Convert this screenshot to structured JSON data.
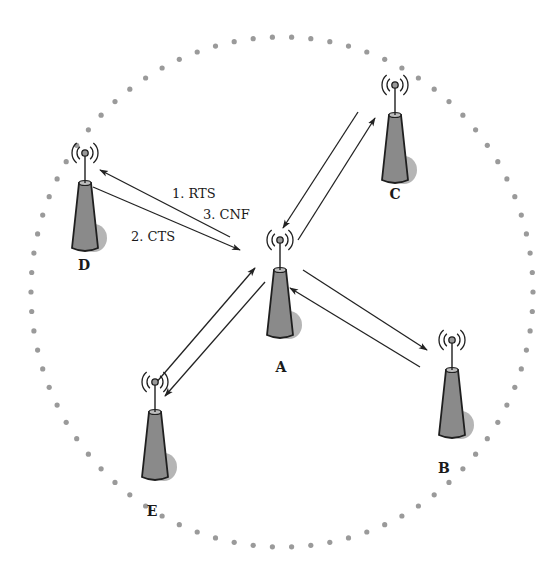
{
  "diagram": {
    "title": "",
    "range_boundary": {
      "style": "dotted",
      "color": "#9a9a9a"
    },
    "colors": {
      "tower_fill": "#8a8a8a",
      "tower_shadow": "#b5b5b5",
      "stroke": "#1f1f1f",
      "arrow": "#222222"
    },
    "nodes": [
      {
        "id": "A",
        "label": "A",
        "role": "center"
      },
      {
        "id": "B",
        "label": "B"
      },
      {
        "id": "C",
        "label": "C"
      },
      {
        "id": "D",
        "label": "D"
      },
      {
        "id": "E",
        "label": "E"
      }
    ],
    "links": [
      {
        "from": "A",
        "to": "D",
        "label": "1. RTS"
      },
      {
        "from": "D",
        "to": "A",
        "label": "2. CTS"
      },
      {
        "from": "A",
        "to": "D",
        "label": "3. CNF"
      },
      {
        "from": "C",
        "to": "A",
        "label": ""
      },
      {
        "from": "A",
        "to": "C",
        "label": ""
      },
      {
        "from": "A",
        "to": "B",
        "label": ""
      },
      {
        "from": "B",
        "to": "A",
        "label": ""
      },
      {
        "from": "E",
        "to": "A",
        "label": ""
      },
      {
        "from": "A",
        "to": "E",
        "label": ""
      }
    ],
    "message_labels": [
      "1. RTS",
      "3. CNF",
      "2. CTS"
    ]
  }
}
